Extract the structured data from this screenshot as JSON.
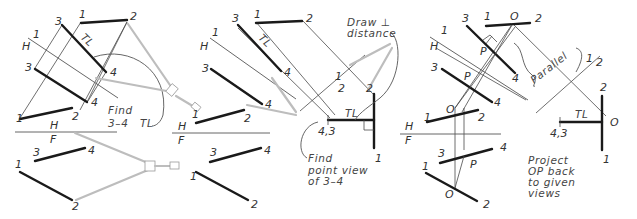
{
  "figure": {
    "panels": [
      {
        "id": "panel-1",
        "title_note": [
          "Find",
          "3–4",
          "TL"
        ],
        "labels": {
          "p3_top": "3",
          "p1_top": "1",
          "p2_top": "2",
          "tl_top": "TL",
          "aux_1": "1",
          "aux_H": "H",
          "aux_3": "3",
          "aux_4a": "4",
          "aux_4b": "4",
          "aux_1b": "1",
          "aux_2b": "2",
          "h": "H",
          "f": "F",
          "front_3": "3",
          "front_4": "4",
          "front_1": "1",
          "front_2": "2"
        }
      },
      {
        "id": "panel-2",
        "note_top": [
          "Draw ⊥",
          "distance"
        ],
        "note_bottom": [
          "Find",
          "point view",
          "of 3–4"
        ],
        "labels": {
          "p3_top": "3",
          "p1_top": "1",
          "p2_top": "2",
          "tl_top": "TL",
          "aux_1": "1",
          "aux_H": "H",
          "aux_3": "3",
          "aux_4a": "4",
          "aux_4b": "4",
          "sec_1": "1",
          "sec_2": "2",
          "sec_2b": "2",
          "tl_sec": "TL",
          "pt_43": "4,3",
          "sec_1b": "1",
          "h_1": "1",
          "h_2": "2",
          "h": "H",
          "f": "F",
          "front_3": "3",
          "front_4": "4",
          "front_1": "1",
          "front_2": "2"
        }
      },
      {
        "id": "panel-3",
        "note_parallel": "Parallel",
        "note_bottom": [
          "Project",
          "OP back",
          "to given",
          "views"
        ],
        "labels": {
          "p3_top": "3",
          "p1_top": "1",
          "o_top": "O",
          "p2_top": "2",
          "aux_1": "1",
          "aux_H": "H",
          "p_a": "P",
          "aux_3": "3",
          "p_b": "P",
          "aux_4a": "4",
          "aux_4b": "4",
          "o_mid": "O",
          "h_1": "1",
          "h_2": "2",
          "h": "H",
          "f": "F",
          "front_3": "3",
          "front_4": "4",
          "front_p": "P",
          "front_1": "1",
          "front_o": "O",
          "front_2": "2",
          "sec_1": "1",
          "sec_2": "2",
          "pv_2": "2",
          "tl": "TL",
          "pv_o": "O",
          "pt_43": "4,3",
          "pv_1": "1"
        }
      }
    ]
  }
}
